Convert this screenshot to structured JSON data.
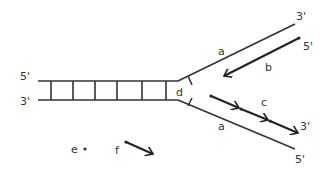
{
  "diagram": {
    "labels": {
      "top_left_5prime": "5'",
      "bottom_left_3prime": "3'",
      "top_right_3prime": "3'",
      "b_end_5prime": "5'",
      "c_end_3prime": "3'",
      "bottom_right_5prime": "5'",
      "a_top": "a",
      "a_bottom": "a",
      "b": "b",
      "c": "c",
      "d": "d",
      "e": "e",
      "f": "f"
    },
    "colors": {
      "stroke": "#333333",
      "text": "#444444",
      "background": "#ffffff"
    }
  }
}
